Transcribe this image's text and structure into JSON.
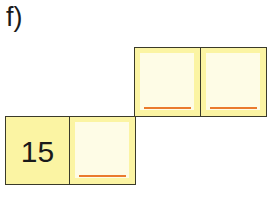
{
  "exercise": {
    "label": "f)",
    "cells": [
      {
        "id": "bottom-left",
        "value": "15",
        "type": "given"
      },
      {
        "id": "bottom-right",
        "value": "",
        "type": "answer"
      },
      {
        "id": "top-left",
        "value": "",
        "type": "answer"
      },
      {
        "id": "top-right",
        "value": "",
        "type": "answer"
      }
    ]
  },
  "colors": {
    "cell_fill": "#fbf4a3",
    "answer_inner": "#fefce6",
    "answer_line": "#ea7a2e",
    "border": "#3a3a2a"
  }
}
